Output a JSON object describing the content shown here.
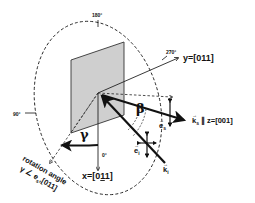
{
  "diagram": {
    "type": "scattering-geometry",
    "colors": {
      "line": "#111111",
      "sample_fill": "#cfcfcf",
      "background": "#ffffff"
    },
    "angle_marks": {
      "deg180": "180°",
      "deg270": "270°",
      "deg90": "90°",
      "deg0": "0°"
    },
    "axes": {
      "y": "y=[011]",
      "x_prefix": "x=[0",
      "x_under": "1",
      "x_suffix": "1]"
    },
    "vectors": {
      "ks_label": "k",
      "ks_sub": "s",
      "ks_rel": "∥ z=[001]",
      "ki_label": "k",
      "ki_sub": "i",
      "es_label": "e",
      "es_sub": "s",
      "ei_label": "e",
      "ei_sub": "i"
    },
    "angles": {
      "beta": "β",
      "gamma": "γ"
    },
    "rotation_note": {
      "line1": "rotation angle",
      "line2": "γ ∠ e",
      "line2_sub": "s",
      "line2_suffix": ",[011]"
    }
  }
}
